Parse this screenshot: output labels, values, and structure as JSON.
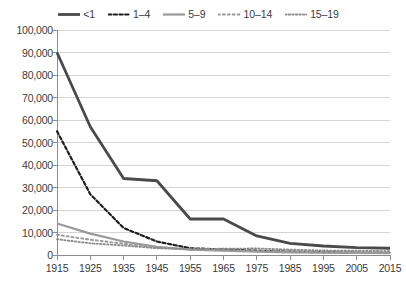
{
  "chart_data": {
    "type": "line",
    "title": "",
    "subtitle": "",
    "xlabel": "",
    "ylabel": "",
    "x": [
      1915,
      1925,
      1935,
      1945,
      1955,
      1965,
      1975,
      1985,
      1995,
      2005,
      2015
    ],
    "x_tick_labels": [
      "1915",
      "1925",
      "1935",
      "1945",
      "1955",
      "1965",
      "1975",
      "1985",
      "1995",
      "2005",
      "2015"
    ],
    "xlim": [
      1915,
      2015
    ],
    "ylim": [
      0,
      100000
    ],
    "y_ticks": [
      0,
      10000,
      20000,
      30000,
      40000,
      50000,
      60000,
      70000,
      80000,
      90000,
      100000
    ],
    "y_tick_labels": [
      "0",
      "10,000",
      "20,000",
      "30,000",
      "40,000",
      "50,000",
      "60,000",
      "70,000",
      "80,000",
      "90,000",
      "100,000"
    ],
    "grid": "horizontal",
    "legend_position": "top-center",
    "series": [
      {
        "name": "<1",
        "style": "solid",
        "color": "#4a4a4a",
        "width": 2.8,
        "values": [
          90000,
          57000,
          34000,
          33000,
          16000,
          16000,
          8500,
          5200,
          4000,
          3300,
          3000
        ]
      },
      {
        "name": "1–4",
        "style": "dashed",
        "color": "#1f1f1f",
        "width": 2.2,
        "values": [
          55000,
          27000,
          12000,
          6000,
          3000,
          2400,
          1900,
          1500,
          1200,
          1000,
          900
        ]
      },
      {
        "name": "5–9",
        "style": "solid",
        "color": "#9a9a9a",
        "width": 2.2,
        "values": [
          14000,
          9500,
          6000,
          3600,
          2400,
          1900,
          1500,
          1200,
          1000,
          900,
          800
        ]
      },
      {
        "name": "10–14",
        "style": "dotted-wide",
        "color": "#9a9a9a",
        "width": 2.0,
        "values": [
          9000,
          6800,
          5000,
          3400,
          2500,
          2100,
          1800,
          1500,
          1300,
          1150,
          1000
        ]
      },
      {
        "name": "15–19",
        "style": "dotted-fine",
        "color": "#8c8c8c",
        "width": 1.8,
        "values": [
          7000,
          5200,
          4200,
          3000,
          2600,
          2800,
          2900,
          2400,
          2000,
          1900,
          1700
        ]
      }
    ]
  },
  "legend": {
    "items": [
      {
        "label": "<1"
      },
      {
        "label": "1–4"
      },
      {
        "label": "5–9"
      },
      {
        "label": "10–14"
      },
      {
        "label": "15–19"
      }
    ]
  },
  "axis": {
    "line_color": "#8c8c8c",
    "grid_color": "#d4d4d4"
  }
}
